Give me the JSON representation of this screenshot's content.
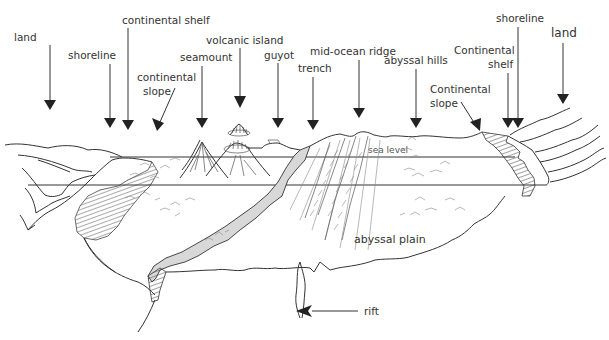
{
  "diagram": {
    "type": "ocean-floor cross-section",
    "labels": {
      "land_left": "land",
      "shoreline_left": "shoreline",
      "continental_shelf_left": "continental shelf",
      "continental_slope_left": "continental slope",
      "seamount": "seamount",
      "volcanic_island": "volcanic island",
      "guyot": "guyot",
      "trench": "trench",
      "mid_ocean_ridge": "mid-ocean ridge",
      "abyssal_hills": "abyssal hills",
      "continental_slope_right": "Continental slope",
      "continental_shelf_right": "Continental shelf",
      "shoreline_right": "shoreline",
      "land_right": "land",
      "sea_level": "sea level",
      "abyssal_plain": "abyssal plain",
      "rift": "rift"
    },
    "label_lines": {
      "continental_slope_left": [
        "continental",
        "slope"
      ],
      "continental_slope_right": [
        "Continental",
        "slope"
      ],
      "continental_shelf_right": [
        "Continental",
        "shelf"
      ]
    }
  }
}
